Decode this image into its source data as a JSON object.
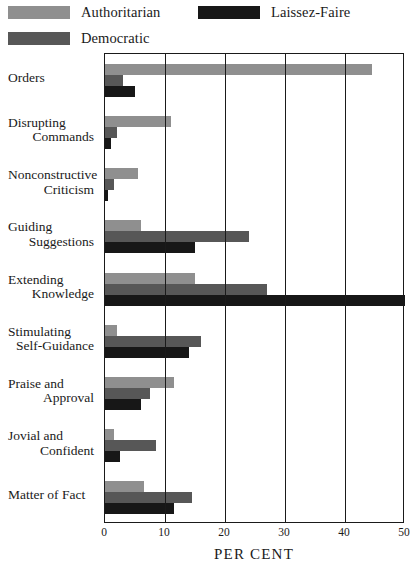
{
  "legend": {
    "items": [
      {
        "label": "Authoritarian",
        "color": "#8f8f8f",
        "key": "authoritarian"
      },
      {
        "label": "Laissez-Faire",
        "color": "#171717",
        "key": "laissez_faire"
      },
      {
        "label": "Democratic",
        "color": "#575757",
        "key": "democratic"
      }
    ]
  },
  "axis": {
    "xlabel": "PER CENT",
    "ticks": [
      "0",
      "10",
      "20",
      "30",
      "40",
      "50"
    ]
  },
  "categories": [
    {
      "line1": "Orders",
      "line2": ""
    },
    {
      "line1": "Disrupting",
      "line2": "Commands"
    },
    {
      "line1": "Nonconstructive",
      "line2": "Criticism"
    },
    {
      "line1": "Guiding",
      "line2": "Suggestions"
    },
    {
      "line1": "Extending",
      "line2": "Knowledge"
    },
    {
      "line1": "Stimulating",
      "line2": "Self-Guidance"
    },
    {
      "line1": "Praise and",
      "line2": "Approval"
    },
    {
      "line1": "Jovial and",
      "line2": "Confident"
    },
    {
      "line1": "Matter of Fact",
      "line2": ""
    }
  ],
  "chart_data": {
    "type": "bar",
    "orientation": "horizontal",
    "title": "",
    "xlabel": "PER CENT",
    "ylabel": "",
    "xlim": [
      0,
      50
    ],
    "xticks": [
      0,
      10,
      20,
      30,
      40,
      50
    ],
    "grid": true,
    "grid_axis": "x",
    "legend_position": "top",
    "categories": [
      "Orders",
      "Disrupting Commands",
      "Nonconstructive Criticism",
      "Guiding Suggestions",
      "Extending Knowledge",
      "Stimulating Self-Guidance",
      "Praise and Approval",
      "Jovial and Confident",
      "Matter of Fact"
    ],
    "series": [
      {
        "name": "Authoritarian",
        "color": "#8f8f8f",
        "values": [
          44.5,
          11,
          5.5,
          6,
          15,
          2,
          11.5,
          1.5,
          6.5
        ]
      },
      {
        "name": "Democratic",
        "color": "#575757",
        "values": [
          3,
          2,
          1.5,
          24,
          27,
          16,
          7.5,
          8.5,
          14.5
        ]
      },
      {
        "name": "Laissez-Faire",
        "color": "#171717",
        "values": [
          5,
          1,
          0.5,
          15,
          50,
          14,
          6,
          2.5,
          11.5
        ]
      }
    ]
  }
}
